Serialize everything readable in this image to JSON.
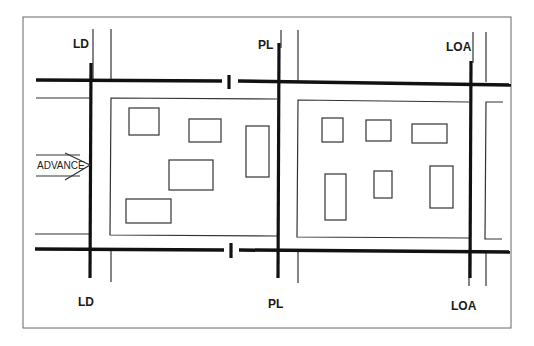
{
  "diagram": {
    "type": "tactical-control-measures",
    "colors": {
      "line": "#1a1a1a",
      "frame": "#555555",
      "background": "#ffffff"
    },
    "labels": {
      "ld_top": "LD",
      "ld_bottom": "LD",
      "pl_top": "PL",
      "pl_bottom": "PL",
      "loa_top": "LOA",
      "loa_bottom": "LOA",
      "advance": "ADVANCE"
    },
    "phase_lines": [
      {
        "name": "LD",
        "meaning": "Line of Departure",
        "x": 91
      },
      {
        "name": "PL",
        "meaning": "Phase Line",
        "x": 279
      },
      {
        "name": "LOA",
        "meaning": "Limit of Advance",
        "x": 471
      }
    ],
    "blocks": [
      {
        "name": "west-block",
        "buildings": [
          {
            "x": 129,
            "y": 108,
            "w": 30,
            "h": 27
          },
          {
            "x": 189,
            "y": 119,
            "w": 32,
            "h": 23
          },
          {
            "x": 246,
            "y": 126,
            "w": 23,
            "h": 51
          },
          {
            "x": 169,
            "y": 160,
            "w": 44,
            "h": 30
          },
          {
            "x": 126,
            "y": 199,
            "w": 45,
            "h": 24
          }
        ]
      },
      {
        "name": "east-block",
        "buildings": [
          {
            "x": 322,
            "y": 118,
            "w": 21,
            "h": 24
          },
          {
            "x": 366,
            "y": 120,
            "w": 25,
            "h": 21
          },
          {
            "x": 412,
            "y": 124,
            "w": 35,
            "h": 19
          },
          {
            "x": 325,
            "y": 174,
            "w": 21,
            "h": 46
          },
          {
            "x": 374,
            "y": 171,
            "w": 18,
            "h": 27
          },
          {
            "x": 430,
            "y": 166,
            "w": 23,
            "h": 42
          }
        ]
      }
    ]
  }
}
